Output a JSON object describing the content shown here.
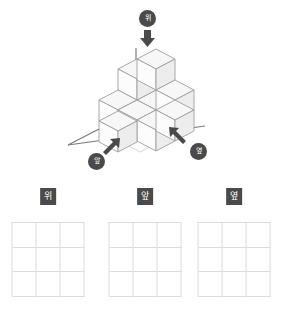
{
  "figure": {
    "caption_badges": [
      {
        "id": "top",
        "label": "위",
        "icon": "arrow-down-icon",
        "direction": "down"
      },
      {
        "id": "front",
        "label": "앞",
        "icon": "arrow-up-right-icon",
        "direction": "up-right"
      },
      {
        "id": "side",
        "label": "옆",
        "icon": "arrow-up-left-icon",
        "direction": "up-left"
      }
    ],
    "axis_color": "#6b6b6b",
    "cube_stroke": "#9a9a9a",
    "cube_top_fill": "#f7f7f7",
    "cube_left_fill": "#fbfbfb",
    "cube_right_fill": "#eeeeee",
    "badge_bg": "#4a4a4a",
    "badge_text": "#ffffff"
  },
  "views": [
    {
      "label": "위",
      "rows": 3,
      "cols": 3,
      "cells": [
        [
          "",
          "",
          ""
        ],
        [
          "",
          "",
          ""
        ],
        [
          "",
          "",
          ""
        ]
      ]
    },
    {
      "label": "앞",
      "rows": 3,
      "cols": 3,
      "cells": [
        [
          "",
          "",
          ""
        ],
        [
          "",
          "",
          ""
        ],
        [
          "",
          "",
          ""
        ]
      ]
    },
    {
      "label": "옆",
      "rows": 3,
      "cols": 3,
      "cells": [
        [
          "",
          "",
          ""
        ],
        [
          "",
          "",
          ""
        ],
        [
          "",
          "",
          ""
        ]
      ]
    }
  ],
  "colors": {
    "grid_line": "#dcdcdc",
    "background": "#ffffff"
  }
}
